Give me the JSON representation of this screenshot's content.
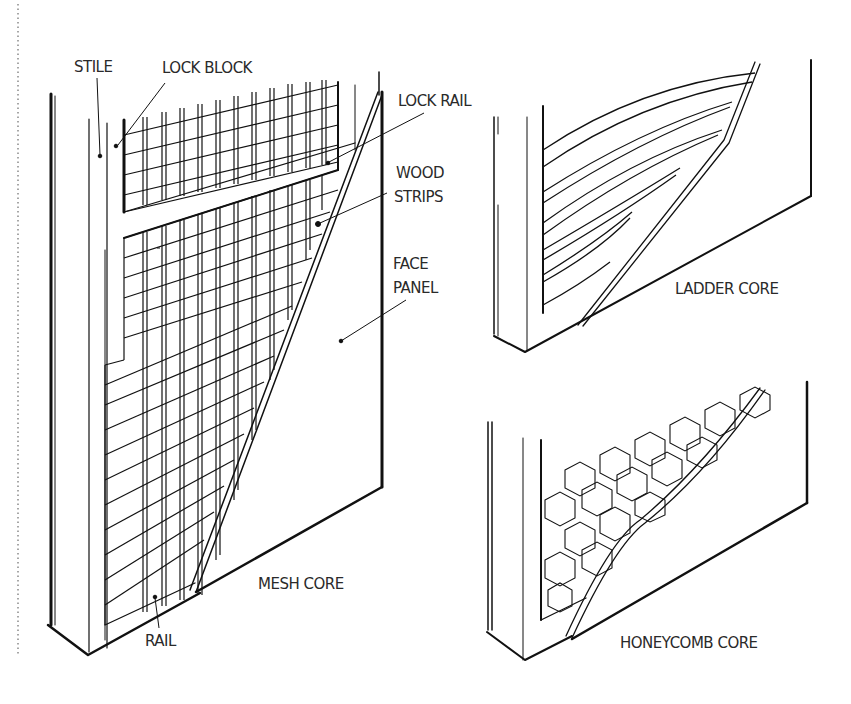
{
  "diagram": {
    "colors": {
      "ink": "#111111",
      "label": "#2a2a2a",
      "background": "#ffffff"
    },
    "panels": [
      {
        "id": "mesh",
        "caption": "MESH CORE",
        "labels": {
          "stile": "STILE",
          "lock_block": "LOCK BLOCK",
          "lock_rail": "LOCK RAIL",
          "wood_strips_1": "WOOD",
          "wood_strips_2": "STRIPS",
          "face_panel_1": "FACE",
          "face_panel_2": "PANEL",
          "rail": "RAIL"
        }
      },
      {
        "id": "ladder",
        "caption": "LADDER CORE"
      },
      {
        "id": "honeycomb",
        "caption": "HONEYCOMB CORE"
      }
    ]
  }
}
